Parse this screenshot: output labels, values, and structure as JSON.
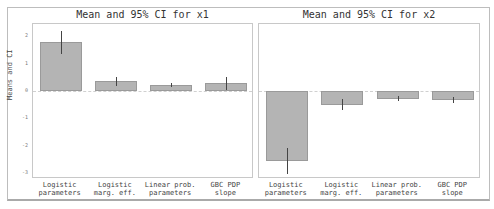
{
  "chart_data": [
    {
      "type": "bar",
      "title": "Mean and 95% CI for x1",
      "xlabel": "",
      "ylabel": "Means and CI",
      "categories": [
        "Logistic\nparameters",
        "Logistic\nmarg. eff.",
        "Linear prob.\nparameters",
        "GBC PDP\nslope"
      ],
      "values": [
        1.8,
        0.36,
        0.21,
        0.3
      ],
      "ci_low": [
        1.35,
        0.2,
        0.13,
        0.05
      ],
      "ci_high": [
        2.2,
        0.52,
        0.3,
        0.5
      ],
      "ylim": [
        -3.2,
        2.5
      ],
      "yticks": [
        2,
        1,
        0,
        -1,
        -2,
        -3
      ],
      "grid": false,
      "zero_line": true
    },
    {
      "type": "bar",
      "title": "Mean and 95% CI for x2",
      "xlabel": "",
      "ylabel": "",
      "categories": [
        "Logistic\nparameters",
        "Logistic\nmarg. eff.",
        "Linear prob.\nparameters",
        "GBC PDP\nslope"
      ],
      "values": [
        -2.57,
        -0.5,
        -0.28,
        -0.33
      ],
      "ci_low": [
        -3.05,
        -0.7,
        -0.35,
        -0.45
      ],
      "ci_high": [
        -2.1,
        -0.3,
        -0.2,
        -0.22
      ],
      "ylim": [
        -3.2,
        2.5
      ],
      "yticks": [],
      "grid": false,
      "zero_line": true
    }
  ],
  "labels": {
    "title_left": "Mean and 95% CI for x1",
    "title_right": "Mean and 95% CI for x2",
    "ylabel": "Means and CI",
    "yticks": [
      "2",
      "1",
      "0",
      "-1",
      "-2",
      "-3"
    ],
    "x": [
      [
        "Logistic",
        "parameters"
      ],
      [
        "Logistic",
        "marg. eff."
      ],
      [
        "Linear prob.",
        "parameters"
      ],
      [
        "GBC PDP",
        "slope"
      ]
    ]
  },
  "colors": {
    "bar": "#b4b4b4",
    "bar_edge": "#9a9a9a",
    "errorbar": "#444444"
  }
}
